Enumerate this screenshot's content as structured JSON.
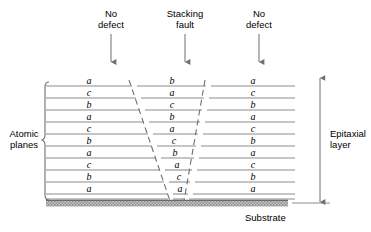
{
  "headers": [
    {
      "name": "no-defect-left",
      "line1": "No",
      "line2": "defect",
      "x": 76,
      "y": 8,
      "arrow_x": 111,
      "arrow_y1": 34,
      "arrow_y2": 62
    },
    {
      "name": "stacking-fault",
      "line1": "Stacking",
      "line2": "fault",
      "x": 150,
      "y": 8,
      "arrow_x": 185,
      "arrow_y1": 34,
      "arrow_y2": 62
    },
    {
      "name": "no-defect-right",
      "line1": "No",
      "line2": "defect",
      "x": 224,
      "y": 8,
      "arrow_x": 259,
      "arrow_y1": 34,
      "arrow_y2": 62
    }
  ],
  "labels": {
    "atomic_planes_line1": "Atomic",
    "atomic_planes_line2": "planes",
    "epitaxial_line1": "Epitaxial",
    "epitaxial_line2": "layer",
    "substrate": "Substrate"
  },
  "columns": {
    "left": {
      "name": "no-defect-left-column",
      "letters": [
        "a",
        "c",
        "b",
        "a",
        "c",
        "b",
        "a",
        "c",
        "b",
        "a"
      ]
    },
    "middle": {
      "name": "stacking-fault-column",
      "letters": [
        "b",
        "a",
        "c",
        "b",
        "a",
        "c",
        "b",
        "a",
        "c",
        "a"
      ]
    },
    "right": {
      "name": "no-defect-right-column",
      "letters": [
        "a",
        "c",
        "b",
        "a",
        "c",
        "b",
        "a",
        "c",
        "b",
        "a"
      ]
    }
  },
  "geometry": {
    "row_ys": [
      81,
      93,
      105,
      117,
      129,
      141,
      153,
      165,
      177,
      189
    ],
    "line_ys": [
      86,
      98,
      110,
      122,
      134,
      146,
      158,
      170,
      182,
      194,
      199
    ],
    "plot_left": 46,
    "plot_right": 295,
    "fault_top_left_x": 129,
    "fault_bot_left_x": 168,
    "fault_top_right_x": 203,
    "fault_bot_right_x": 183,
    "fault_top_y": 80,
    "fault_bot_y": 199,
    "substrate_top": 200,
    "substrate_bottom": 206,
    "substrate_left": 46,
    "substrate_right": 288,
    "epi_arrow_x": 320,
    "epi_arrow_top": 78,
    "epi_arrow_bottom": 202,
    "brace_x": 45,
    "brace_top": 82,
    "brace_bottom": 200
  },
  "colors": {
    "line": "#8c8c8c",
    "text": "#000000",
    "fault_line": "#6f6f6f",
    "substrate_fill": "#b5b5b5",
    "substrate_edge": "#7a7a7a",
    "arrow": "#6f6f6f"
  }
}
